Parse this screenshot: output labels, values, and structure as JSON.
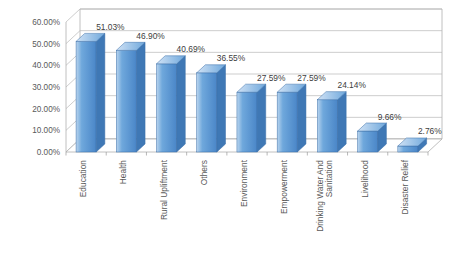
{
  "chart_data": {
    "type": "bar",
    "title": "",
    "subtitle": "",
    "xlabel": "",
    "ylabel": "",
    "ylim": [
      0,
      60
    ],
    "ytick_step": 10,
    "ytick_labels": [
      "0.00%",
      "10.00%",
      "20.00%",
      "30.00%",
      "40.00%",
      "50.00%",
      "60.00%"
    ],
    "ytick_values": [
      0,
      10,
      20,
      30,
      40,
      50,
      60
    ],
    "grid": true,
    "legend": false,
    "legend_position": "none",
    "value_labels_shown": true,
    "value_label_suffix": "%",
    "categories": [
      "Education",
      "Health",
      "Rural Upliftment",
      "Others",
      "Environment",
      "Empowerment",
      "Drinking Water And Sanitation",
      "Livelihood",
      "Disaster Relief"
    ],
    "values": [
      51.03,
      46.9,
      40.69,
      36.55,
      27.59,
      27.59,
      24.14,
      9.66,
      2.76
    ],
    "value_labels": [
      "51.03%",
      "46.90%",
      "40.69%",
      "36.55%",
      "27.59%",
      "27.59%",
      "24.14%",
      "9.66%",
      "2.76%"
    ],
    "series": [
      {
        "name": "",
        "values": [
          51.03,
          46.9,
          40.69,
          36.55,
          27.59,
          27.59,
          24.14,
          9.66,
          2.76
        ]
      }
    ],
    "style": {
      "bar_fill_light": "#b9d4ee",
      "bar_fill_mid": "#6fa8dc",
      "bar_fill_dark": "#4a86c8",
      "bar_top": "#d0e2f5",
      "bar_side": "#3f78b5",
      "bar_outline": "#3b6fa8",
      "grid_color": "#b8b8b8",
      "wall_color": "#b0b0b0",
      "text_color": "#595959",
      "background": "#ffffff"
    }
  },
  "axis": {
    "y_ticks": [
      {
        "label": "60.00%",
        "value": 60
      },
      {
        "label": "50.00%",
        "value": 50
      },
      {
        "label": "40.00%",
        "value": 40
      },
      {
        "label": "30.00%",
        "value": 30
      },
      {
        "label": "20.00%",
        "value": 20
      },
      {
        "label": "10.00%",
        "value": 10
      },
      {
        "label": "0.00%",
        "value": 0
      }
    ]
  },
  "bars": [
    {
      "category": "Education",
      "label": "51.03%",
      "value": 51.03
    },
    {
      "category": "Health",
      "label": "46.90%",
      "value": 46.9
    },
    {
      "category": "Rural Upliftment",
      "label": "40.69%",
      "value": 40.69
    },
    {
      "category": "Others",
      "label": "36.55%",
      "value": 36.55
    },
    {
      "category": "Environment",
      "label": "27.59%",
      "value": 27.59
    },
    {
      "category": "Empowerment",
      "label": "27.59%",
      "value": 27.59
    },
    {
      "category": "Drinking Water And Sanitation",
      "label": "24.14%",
      "value": 24.14
    },
    {
      "category": "Livelihood",
      "label": "9.66%",
      "value": 9.66
    },
    {
      "category": "Disaster Relief",
      "label": "2.76%",
      "value": 2.76
    }
  ],
  "category_label_lines": [
    [
      "Education"
    ],
    [
      "Health"
    ],
    [
      "Rural Upliftment"
    ],
    [
      "Others"
    ],
    [
      "Environment"
    ],
    [
      "Empowerment"
    ],
    [
      "Drinking Water And",
      "Sanitation"
    ],
    [
      "Livelihood"
    ],
    [
      "Disaster Relief"
    ]
  ]
}
